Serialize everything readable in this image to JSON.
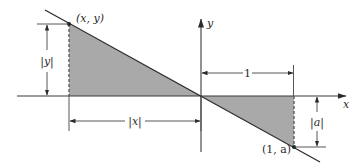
{
  "diagram": {
    "type": "geometry-figure",
    "colors": {
      "line": "#2b2b2b",
      "shade": "#a9a9a9",
      "axis": "#3a3a3a",
      "dashed": "#555555",
      "background": "#ffffff"
    },
    "axes": {
      "x_label": "x",
      "y_label": "y"
    },
    "points": {
      "p1_label": "(x, y)",
      "p2_label": "(1, a)"
    },
    "dimensions": {
      "abs_y": "|y|",
      "abs_x": "|x|",
      "one": "1",
      "abs_a": "|a|"
    }
  }
}
